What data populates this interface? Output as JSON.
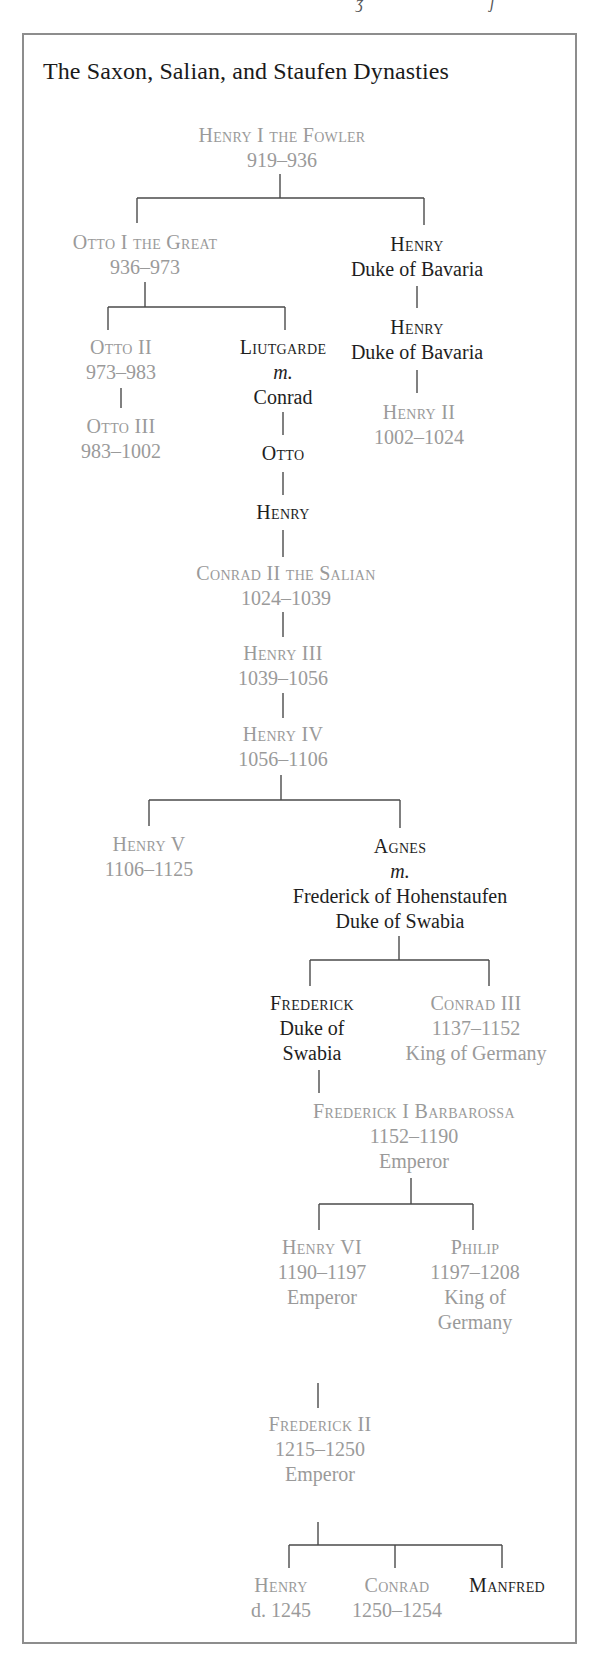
{
  "title": "The Saxon, Salian, and Staufen Dynasties",
  "colors": {
    "ruler_text": "#9a9a9a",
    "non_ruler_text": "#1e1e1e",
    "frame_border": "#8d8d8d",
    "connector": "#4a4a4a"
  },
  "nodes": {
    "henry1": {
      "name": "Henry I the Fowler",
      "lines": [
        "919–936"
      ],
      "ruler": true
    },
    "otto1": {
      "name": "Otto I the Great",
      "lines": [
        "936–973"
      ],
      "ruler": true
    },
    "henry_bav1": {
      "name": "Henry",
      "lines": [
        "Duke of Bavaria"
      ],
      "ruler": false
    },
    "henry_bav2": {
      "name": "Henry",
      "lines": [
        "Duke of Bavaria"
      ],
      "ruler": false
    },
    "henry2": {
      "name": "Henry II",
      "lines": [
        "1002–1024"
      ],
      "ruler": true
    },
    "otto2": {
      "name": "Otto II",
      "lines": [
        "973–983"
      ],
      "ruler": true
    },
    "otto3": {
      "name": "Otto III",
      "lines": [
        "983–1002"
      ],
      "ruler": true
    },
    "liutgarde": {
      "name": "Liutgarde",
      "lines": [
        "m.",
        "Conrad"
      ],
      "ruler": false
    },
    "otto": {
      "name": "Otto",
      "lines": [],
      "ruler": false
    },
    "henry": {
      "name": "Henry",
      "lines": [],
      "ruler": false
    },
    "conrad2": {
      "name": "Conrad II the Salian",
      "lines": [
        "1024–1039"
      ],
      "ruler": true
    },
    "henry3": {
      "name": "Henry III",
      "lines": [
        "1039–1056"
      ],
      "ruler": true
    },
    "henry4": {
      "name": "Henry IV",
      "lines": [
        "1056–1106"
      ],
      "ruler": true
    },
    "henry5": {
      "name": "Henry V",
      "lines": [
        "1106–1125"
      ],
      "ruler": true
    },
    "agnes": {
      "name": "Agnes",
      "lines": [
        "m.",
        "Frederick of Hohenstaufen",
        "Duke of Swabia"
      ],
      "ruler": false
    },
    "frederick_swabia": {
      "name": "Frederick",
      "lines": [
        "Duke of",
        "Swabia"
      ],
      "ruler": false
    },
    "conrad3": {
      "name": "Conrad III",
      "lines": [
        "1137–1152",
        "King of Germany"
      ],
      "ruler": true
    },
    "barbarossa": {
      "name": "Frederick I Barbarossa",
      "lines": [
        "1152–1190",
        "Emperor"
      ],
      "ruler": true
    },
    "henry6": {
      "name": "Henry VI",
      "lines": [
        "1190–1197",
        "Emperor"
      ],
      "ruler": true
    },
    "philip": {
      "name": "Philip",
      "lines": [
        "1197–1208",
        "King of",
        "Germany"
      ],
      "ruler": true
    },
    "frederick2": {
      "name": "Frederick II",
      "lines": [
        "1215–1250",
        "Emperor"
      ],
      "ruler": true
    },
    "henry_d": {
      "name": "Henry",
      "lines": [
        "d. 1245"
      ],
      "ruler": true
    },
    "conrad4": {
      "name": "Conrad",
      "lines": [
        "1250–1254"
      ],
      "ruler": true
    },
    "manfred": {
      "name": "Manfred",
      "lines": [],
      "ruler": false
    }
  },
  "edges": [
    [
      "henry1",
      "otto1"
    ],
    [
      "henry1",
      "henry_bav1"
    ],
    [
      "otto1",
      "otto2"
    ],
    [
      "otto1",
      "liutgarde"
    ],
    [
      "henry_bav1",
      "henry_bav2"
    ],
    [
      "henry_bav2",
      "henry2"
    ],
    [
      "otto2",
      "otto3"
    ],
    [
      "liutgarde",
      "otto"
    ],
    [
      "otto",
      "henry"
    ],
    [
      "henry",
      "conrad2"
    ],
    [
      "conrad2",
      "henry3"
    ],
    [
      "henry3",
      "henry4"
    ],
    [
      "henry4",
      "henry5"
    ],
    [
      "henry4",
      "agnes"
    ],
    [
      "agnes",
      "frederick_swabia"
    ],
    [
      "agnes",
      "conrad3"
    ],
    [
      "frederick_swabia",
      "barbarossa"
    ],
    [
      "barbarossa",
      "henry6"
    ],
    [
      "barbarossa",
      "philip"
    ],
    [
      "henry6",
      "frederick2"
    ],
    [
      "frederick2",
      "henry_d"
    ],
    [
      "frederick2",
      "conrad4"
    ],
    [
      "frederick2",
      "manfred"
    ]
  ]
}
